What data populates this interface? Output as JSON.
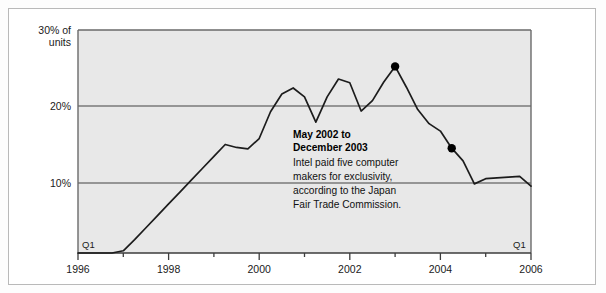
{
  "chart_data": {
    "type": "line",
    "title": "",
    "subtitle": "",
    "xlabel": "",
    "ylabel": "30% of units",
    "y_axis": {
      "ticks": [
        {
          "value": 30,
          "label": "30% of"
        },
        {
          "value": 30,
          "label": "units"
        },
        {
          "value": 20,
          "label": "20%"
        },
        {
          "value": 10,
          "label": "10%"
        }
      ],
      "ylim": [
        0,
        30
      ],
      "gridlines": [
        20,
        10
      ],
      "grid": true
    },
    "x_axis": {
      "tick_labels": [
        "1996",
        "1998",
        "2000",
        "2002",
        "2004",
        "2006"
      ],
      "minor_ticks": [
        "1997",
        "1999",
        "2001",
        "2003",
        "2005"
      ],
      "xlim": [
        1996,
        2006
      ],
      "edge_label_left": "Q1",
      "edge_label_right": "Q1"
    },
    "legend": {
      "position": "none",
      "entries": []
    },
    "series": [
      {
        "name": "AMD share of units",
        "x": [
          1996.0,
          1996.25,
          1996.5,
          1996.75,
          1997.0,
          1997.25,
          1997.5,
          1997.75,
          1998.0,
          1998.25,
          1998.5,
          1998.75,
          1999.0,
          1999.25,
          1999.5,
          1999.75,
          2000.0,
          2000.25,
          2000.5,
          2000.75,
          2001.0,
          2001.25,
          2001.5,
          2001.75,
          2002.0,
          2002.25,
          2002.5,
          2002.75,
          2003.0,
          2003.25,
          2003.5,
          2003.75,
          2004.0,
          2004.25,
          2004.5,
          2004.75,
          2005.0,
          2005.25,
          2005.5,
          2005.75,
          2006.0
        ],
        "y": [
          0.0,
          0.0,
          0.0,
          0.0,
          0.3,
          1.8,
          3.4,
          5.0,
          6.6,
          8.2,
          9.8,
          11.4,
          13.0,
          14.6,
          14.2,
          14.0,
          15.4,
          19.0,
          21.4,
          22.2,
          21.0,
          17.6,
          21.0,
          23.4,
          22.9,
          19.1,
          20.5,
          23.0,
          25.1,
          22.3,
          19.3,
          17.4,
          16.4,
          14.1,
          12.4,
          9.3,
          10.0,
          10.1,
          10.2,
          10.3,
          9.0
        ]
      }
    ],
    "markers": [
      {
        "label": "peak-marker",
        "x": 2003.0,
        "y": 25.1
      },
      {
        "label": "decline-marker",
        "x": 2004.25,
        "y": 14.1
      }
    ]
  },
  "annotation": {
    "heading_line1": "May 2002 to",
    "heading_line2": "December 2003",
    "body_line1": "Intel paid five computer",
    "body_line2": "makers for exclusivity,",
    "body_line3": "according to the Japan",
    "body_line4": "Fair Trade Commission."
  },
  "colors": {
    "plot_background": "#e8e8e8",
    "gridline": "#7a7a7a",
    "axis": "#5a5a5a",
    "line": "#1c1c1c",
    "marker": "#000000",
    "frame_border": "#b9b9b9",
    "page_background": "#ffffff"
  }
}
